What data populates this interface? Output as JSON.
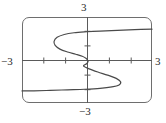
{
  "figure": {
    "kind": "cartesian-graph",
    "frame_shape": "rounded-rectangle",
    "stroke_color": "#4a4a4a",
    "axis_color": "#5a5a5a",
    "frame_color": "#6e6e6e"
  },
  "labels": {
    "top": "3",
    "bottom": "−3",
    "left": "−3",
    "right": "3"
  },
  "chart_data": {
    "type": "line",
    "title": "",
    "xlabel": "",
    "ylabel": "",
    "xlim": [
      -3,
      3
    ],
    "ylim": [
      -3,
      3
    ],
    "grid": false,
    "legend": "none",
    "x_tick_labels": [
      "−3",
      "3"
    ],
    "y_tick_labels": [
      "−3",
      "3"
    ],
    "x_ticks": [
      -3,
      -2,
      -1,
      1,
      2,
      3
    ],
    "y_ticks": [
      -3,
      -2,
      -1,
      1,
      2,
      3
    ],
    "unlabeled_tick_count_x": 4,
    "unlabeled_tick_count_y": 4,
    "orientation": "relation-x-as-function-of-y",
    "series": [
      {
        "name": "curve",
        "points": [
          [
            3.0,
            2.15
          ],
          [
            2.2,
            2.12
          ],
          [
            1.4,
            2.07
          ],
          [
            0.6,
            2.02
          ],
          [
            0.0,
            1.97
          ],
          [
            -0.6,
            1.9
          ],
          [
            -1.05,
            1.78
          ],
          [
            -1.38,
            1.58
          ],
          [
            -1.52,
            1.3
          ],
          [
            -1.47,
            1.02
          ],
          [
            -1.25,
            0.76
          ],
          [
            -0.9,
            0.56
          ],
          [
            -0.52,
            0.4
          ],
          [
            -0.22,
            0.26
          ],
          [
            -0.05,
            0.12
          ],
          [
            0.02,
            0.0
          ],
          [
            0.05,
            -0.12
          ],
          [
            -0.02,
            -0.26
          ],
          [
            -0.16,
            -0.42
          ],
          [
            0.1,
            -0.62
          ],
          [
            0.5,
            -0.84
          ],
          [
            0.95,
            -1.06
          ],
          [
            1.35,
            -1.28
          ],
          [
            1.55,
            -1.52
          ],
          [
            1.48,
            -1.74
          ],
          [
            1.15,
            -1.88
          ],
          [
            0.6,
            -1.98
          ],
          [
            -0.1,
            -2.04
          ],
          [
            -0.9,
            -2.08
          ],
          [
            -1.7,
            -2.12
          ],
          [
            -2.45,
            -2.15
          ],
          [
            -3.0,
            -2.16
          ]
        ]
      }
    ]
  }
}
